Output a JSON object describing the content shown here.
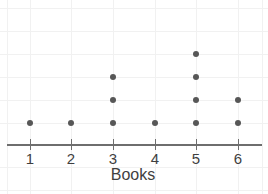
{
  "chart_data": {
    "type": "scatter",
    "plot_style": "dot-plot",
    "title": "",
    "xlabel": "Books",
    "ylabel": "",
    "categories": [
      "1",
      "2",
      "3",
      "4",
      "5",
      "6"
    ],
    "values": [
      1,
      1,
      3,
      1,
      4,
      2
    ],
    "series": [
      {
        "name": "Books",
        "values": [
          1,
          1,
          3,
          1,
          4,
          2
        ]
      }
    ],
    "tick_labels": [
      "1",
      "2",
      "3",
      "4",
      "5",
      "6"
    ],
    "xlim": [
      0.5,
      6.5
    ],
    "ylim": [
      0,
      5
    ],
    "grid": true,
    "legend": false,
    "total_dots": 12,
    "dot_color": "#575757",
    "axis_color": "#6e6e6e",
    "grid_color": "#f1f1f1",
    "text_color": "#3f3f3f"
  },
  "axis": {
    "title": "Books",
    "ticks": [
      {
        "label": "1",
        "x": 30,
        "count": 1
      },
      {
        "label": "2",
        "x": 71,
        "count": 1
      },
      {
        "label": "3",
        "x": 113,
        "count": 3
      },
      {
        "label": "4",
        "x": 155,
        "count": 1
      },
      {
        "label": "5",
        "x": 196,
        "count": 4
      },
      {
        "label": "6",
        "x": 238,
        "count": 2
      }
    ]
  },
  "layout": {
    "baseline_y": 123,
    "row_spacing": 23,
    "grid_v_x": [
      30,
      71,
      113,
      155,
      196,
      238,
      262,
      7
    ],
    "grid_h_y": [
      8,
      31,
      54,
      77,
      100,
      123,
      167,
      190
    ]
  }
}
